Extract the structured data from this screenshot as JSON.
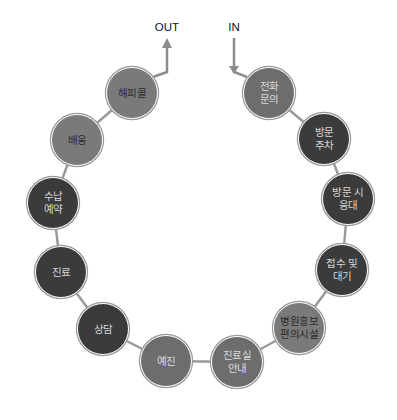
{
  "diagram": {
    "type": "circular process flow",
    "entry_label": "IN",
    "exit_label": "OUT",
    "colors": {
      "dark": "#3b3b3b",
      "mid": "#6d6d6d",
      "light": "#7a7a7a",
      "connector": "#9a9a9a"
    },
    "nodes": [
      {
        "id": "phone-inquiry",
        "label": "전화\n문의",
        "shade": "mid",
        "x": 269,
        "y": 93
      },
      {
        "id": "visit-parking",
        "label": "방문\n주차",
        "shade": "dark",
        "x": 324,
        "y": 139
      },
      {
        "id": "visit-reception",
        "label": "방문 시\n응대",
        "shade": "dark",
        "x": 348,
        "y": 199
      },
      {
        "id": "registration-waiting",
        "label": "접수 및\n대기",
        "shade": "dark",
        "x": 342,
        "y": 270
      },
      {
        "id": "hospital-promo-amenities",
        "label": "병원홍보\n편의시설",
        "shade": "light",
        "x": 299,
        "y": 328
      },
      {
        "id": "exam-room-guide",
        "label": "진료실\n안내",
        "shade": "mid",
        "x": 237,
        "y": 362
      },
      {
        "id": "pre-exam",
        "label": "예진",
        "shade": "mid",
        "x": 166,
        "y": 361
      },
      {
        "id": "consultation",
        "label": "상담",
        "shade": "dark",
        "x": 103,
        "y": 329
      },
      {
        "id": "treatment",
        "label": "진료",
        "shade": "dark",
        "x": 61,
        "y": 272
      },
      {
        "id": "payment-reservation",
        "label": "수납\n예약",
        "shade": "dark",
        "x": 53,
        "y": 203
      },
      {
        "id": "send-off",
        "label": "배웅",
        "shade": "light",
        "x": 77,
        "y": 140
      },
      {
        "id": "happy-call",
        "label": "해피콜",
        "shade": "light",
        "x": 132,
        "y": 93
      }
    ]
  }
}
